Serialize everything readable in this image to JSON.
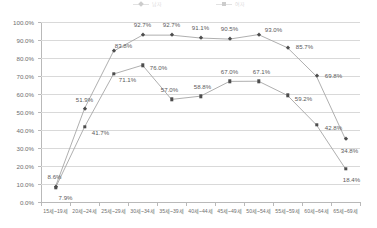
{
  "chart_data": {
    "type": "line",
    "title": "",
    "xlabel": "",
    "ylabel": "",
    "ylim": [
      0,
      100
    ],
    "ytick_labels": [
      "100.0%",
      "90.0%",
      "80.0%",
      "70.0%",
      "60.0%",
      "50.0%",
      "40.0%",
      "30.0%",
      "20.0%",
      "10.0%",
      "0.0%"
    ],
    "ytick_values": [
      100,
      90,
      80,
      70,
      60,
      50,
      40,
      30,
      20,
      10,
      0
    ],
    "grid": true,
    "legend_position": "top",
    "categories": [
      "15세~19세",
      "20세~24세",
      "25세~29세",
      "30세~34세",
      "35세~39세",
      "40세~44세",
      "45세~49세",
      "50세~54세",
      "55세~59세",
      "60세~64세",
      "65세~69세"
    ],
    "series": [
      {
        "name": "남자",
        "marker": "diamond",
        "color": "#4d4d4d",
        "line_color": "#a6a6a6",
        "values": [
          8.6,
          51.9,
          83.8,
          92.7,
          92.7,
          91.1,
          90.5,
          93.0,
          85.7,
          69.8,
          34.8
        ],
        "labels": [
          "8.6%",
          "51.9%",
          "83.8%",
          "92.7%",
          "92.7%",
          "91.1%",
          "90.5%",
          "93.0%",
          "85.7%",
          "69.8%",
          "34.8%"
        ]
      },
      {
        "name": "여자",
        "marker": "square",
        "color": "#4d4d4d",
        "line_color": "#a6a6a6",
        "values": [
          7.9,
          41.7,
          71.1,
          76.0,
          57.0,
          58.8,
          67.0,
          67.1,
          59.2,
          42.8,
          18.4
        ],
        "labels": [
          "7.9%",
          "41.7%",
          "71.1%",
          "76.0%",
          "57.0%",
          "58.8%",
          "67.0%",
          "67.1%",
          "59.2%",
          "42.8%",
          "18.4%"
        ]
      }
    ]
  }
}
